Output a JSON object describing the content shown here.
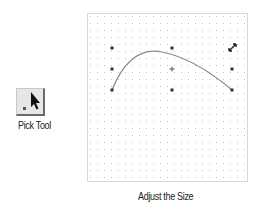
{
  "tool": {
    "label": "Pick Tool",
    "icon": "pick-arrow-icon"
  },
  "canvas": {
    "caption": "Adjust the Size",
    "grid_spacing": 7,
    "handles": [
      {
        "x": 25,
        "y": 35,
        "kind": "corner"
      },
      {
        "x": 85,
        "y": 35,
        "kind": "edge"
      },
      {
        "x": 145,
        "y": 35,
        "kind": "corner-active"
      },
      {
        "x": 25,
        "y": 56,
        "kind": "edge"
      },
      {
        "x": 85,
        "y": 56,
        "kind": "center"
      },
      {
        "x": 145,
        "y": 56,
        "kind": "edge"
      },
      {
        "x": 25,
        "y": 77,
        "kind": "corner"
      },
      {
        "x": 85,
        "y": 77,
        "kind": "edge"
      },
      {
        "x": 145,
        "y": 77,
        "kind": "corner"
      }
    ],
    "cursor": "diagonal-resize-cursor"
  },
  "colors": {
    "grid_dot": "#c4c4c4",
    "border": "#b0b0b0",
    "curve": "#8a8a8a",
    "handle": "#333333"
  }
}
